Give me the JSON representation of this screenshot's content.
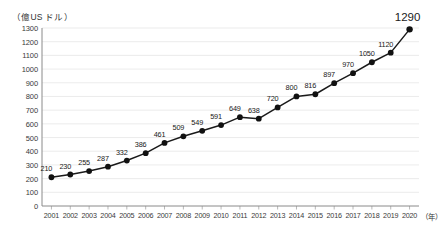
{
  "chart_data": {
    "type": "line",
    "title": "",
    "xlabel": "（年）",
    "ylabel": "（億US ドル）",
    "ylim": [
      0,
      1300
    ],
    "y_ticks": [
      0,
      100,
      200,
      300,
      400,
      500,
      600,
      700,
      800,
      900,
      1000,
      1100,
      1200,
      1300
    ],
    "grid": true,
    "legend": "none",
    "categories": [
      "2001",
      "2002",
      "2003",
      "2004",
      "2005",
      "2006",
      "2007",
      "2008",
      "2009",
      "2010",
      "2011",
      "2012",
      "2013",
      "2014",
      "2015",
      "2016",
      "2017",
      "2018",
      "2019",
      "2020"
    ],
    "values": [
      210,
      230,
      255,
      287,
      332,
      386,
      461,
      509,
      549,
      591,
      649,
      638,
      720,
      800,
      816,
      897,
      970,
      1050,
      1120,
      1290
    ],
    "point_labels": [
      "210",
      "230",
      "255",
      "287",
      "332",
      "386",
      "461",
      "509",
      "549",
      "591",
      "649",
      "638",
      "720",
      "800",
      "816",
      "897",
      "970",
      "1050",
      "1120",
      "1290"
    ],
    "emphasized_point_index": 19,
    "colors": {
      "line": "#1a1a1a",
      "marker": "#111111",
      "grid": "#e3e3e3",
      "axis": "#8a8a8a",
      "text": "#1a1a1a"
    }
  }
}
